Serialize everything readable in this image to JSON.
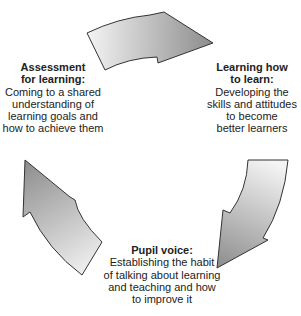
{
  "diagram": {
    "type": "cycle",
    "colors": {
      "arrow_light": "#f4f4f4",
      "arrow_dark": "#8c8c8c",
      "arrow_stroke": "#333333",
      "text": "#222222"
    },
    "stages": [
      {
        "id": "assessment-for-learning",
        "title_lines": [
          "Assessment",
          "for learning:"
        ],
        "desc_lines": [
          "Coming to a shared",
          "understanding of",
          "learning goals and",
          "how to achieve them"
        ]
      },
      {
        "id": "learning-how-to-learn",
        "title_lines": [
          "Learning how",
          "to learn:"
        ],
        "desc_lines": [
          "Developing the",
          "skills and attitudes",
          "to become",
          "better learners"
        ]
      },
      {
        "id": "pupil-voice",
        "title_lines": [
          "Pupil voice:"
        ],
        "desc_lines": [
          "Establishing the habit",
          "of talking about learning",
          "and teaching and how",
          "to improve it"
        ]
      }
    ],
    "arrows": [
      {
        "id": "arrow-top",
        "from": "assessment-for-learning",
        "to": "learning-how-to-learn",
        "direction": "right"
      },
      {
        "id": "arrow-right",
        "from": "learning-how-to-learn",
        "to": "pupil-voice",
        "direction": "down-left"
      },
      {
        "id": "arrow-left",
        "from": "pupil-voice",
        "to": "assessment-for-learning",
        "direction": "up"
      }
    ]
  }
}
